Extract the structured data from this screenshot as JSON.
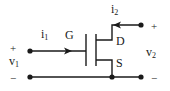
{
  "diagram": {
    "type": "mosfet-two-port-circuit",
    "labels": {
      "gate": "G",
      "drain": "D",
      "source": "S",
      "i1": "i",
      "i1_sub": "1",
      "i2": "i",
      "i2_sub": "2",
      "v1": "v",
      "v1_sub": "1",
      "v2": "v",
      "v2_sub": "2",
      "v1_plus": "+",
      "v1_minus": "−",
      "v2_plus": "+",
      "v2_minus": "−"
    },
    "colors": {
      "ink": "#1a1a1a",
      "background": "#ffffff"
    }
  }
}
